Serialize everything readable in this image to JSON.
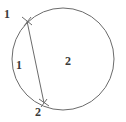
{
  "figure": {
    "type": "circle-with-chord",
    "background_color": "#ffffff",
    "stroke_color": "#6b6b6b",
    "label_color": "#3a3a3a",
    "circle": {
      "center_x": 63,
      "center_y": 59,
      "radius": 51,
      "stroke_width": 1
    },
    "chord": {
      "x1": 27,
      "y1": 21,
      "x2": 44,
      "y2": 103,
      "stroke_width": 1
    },
    "tick_marks": [
      {
        "name": "top-endpoint-tick",
        "x": 27,
        "y": 21
      },
      {
        "name": "bottom-endpoint-tick",
        "x": 44,
        "y": 103
      }
    ],
    "labels": {
      "point_top": "1",
      "region_left": "1",
      "region_right": "2",
      "point_bottom": "2"
    }
  }
}
